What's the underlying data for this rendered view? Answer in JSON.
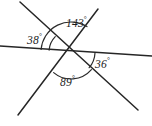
{
  "figure": {
    "background_color": "#ffffff",
    "stroke_color": "#262626",
    "label_color": "#1d1d1d",
    "degree_symbol": "°"
  },
  "vertex": {
    "x": 71,
    "y": 52
  },
  "lines": [
    {
      "name": "horizontal-line",
      "x1": 0,
      "y1": 46,
      "x2": 152,
      "y2": 56
    },
    {
      "name": "upper-left-to-lower-right-line",
      "x1": 20,
      "y1": 2,
      "x2": 138,
      "y2": 110
    },
    {
      "name": "upper-right-to-lower-left-line",
      "x1": 98,
      "y1": 9,
      "x2": 18,
      "y2": 115
    }
  ],
  "arcs": [
    {
      "name": "arc-143",
      "radius": 30
    },
    {
      "name": "arc-38",
      "radius": 22
    },
    {
      "name": "arc-36",
      "radius": 24
    },
    {
      "name": "arc-89",
      "radius": 27
    }
  ],
  "angles": [
    {
      "id": "top",
      "name": "angle-143",
      "value": "143",
      "unit": "°",
      "position": "top"
    },
    {
      "id": "left",
      "name": "angle-38",
      "value": "38",
      "unit": "°",
      "position": "upper-left"
    },
    {
      "id": "right",
      "name": "angle-36",
      "value": "36",
      "unit": "°",
      "position": "lower-right"
    },
    {
      "id": "bottom",
      "name": "angle-89",
      "value": "89",
      "unit": "°",
      "position": "bottom"
    }
  ],
  "chart_data": {
    "type": "diagram",
    "categories": [
      "143°",
      "38°",
      "36°",
      "89°"
    ],
    "values": [
      143,
      38,
      36,
      89
    ],
    "annotations": [
      "143°",
      "38°",
      "36°",
      "89°"
    ]
  }
}
